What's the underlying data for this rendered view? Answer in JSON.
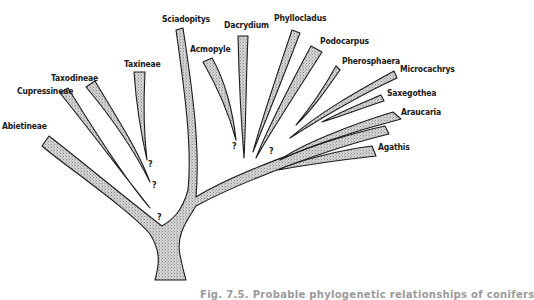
{
  "figure": {
    "type": "phylogenetic-tree",
    "fill_color": "#c8c8c8",
    "stroke_color": "#1c1c1c",
    "caption_truncated": "Fig. 7.5. Probable phylogenetic relationships of conifers"
  },
  "taxa": [
    {
      "id": "abietineae",
      "label": "Abietineae",
      "uncertain": true
    },
    {
      "id": "cupressineae",
      "label": "Cupressineae",
      "uncertain": true
    },
    {
      "id": "taxodineae",
      "label": "Taxodineae",
      "uncertain": true
    },
    {
      "id": "taxineae",
      "label": "Taxineae",
      "uncertain": false
    },
    {
      "id": "sciadopitys",
      "label": "Sciadopitys",
      "uncertain": false
    },
    {
      "id": "acmopyle",
      "label": "Acmopyle",
      "uncertain": true
    },
    {
      "id": "dacrydium",
      "label": "Dacrydium",
      "uncertain": false
    },
    {
      "id": "phyllocladus",
      "label": "Phyllocladus",
      "uncertain": false
    },
    {
      "id": "podocarpus",
      "label": "Podocarpus",
      "uncertain": false
    },
    {
      "id": "pherosphaera",
      "label": "Pherosphaera",
      "uncertain": true
    },
    {
      "id": "microcachrys",
      "label": "Microcachrys",
      "uncertain": false
    },
    {
      "id": "saxegothea",
      "label": "Saxegothea",
      "uncertain": false
    },
    {
      "id": "araucaria",
      "label": "Araucaria",
      "uncertain": false
    },
    {
      "id": "agathis",
      "label": "Agathis",
      "uncertain": false
    }
  ],
  "question_mark": "?"
}
